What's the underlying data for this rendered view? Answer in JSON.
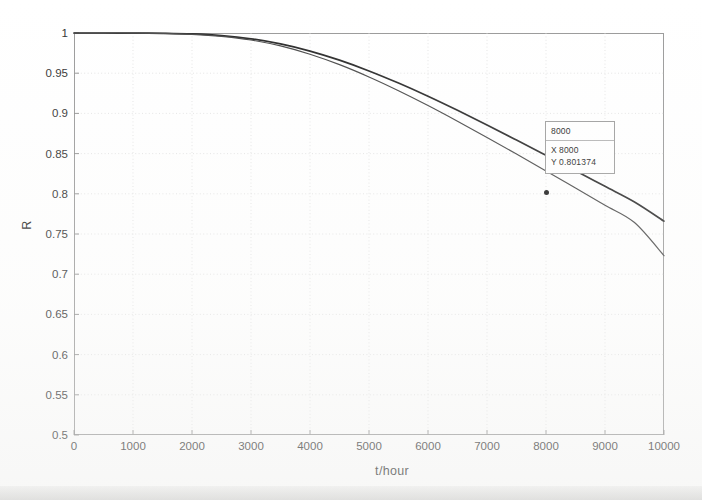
{
  "chart_data": {
    "type": "line",
    "title": "",
    "xlabel": "t/hour",
    "ylabel": "R",
    "xlim": [
      0,
      10000
    ],
    "ylim": [
      0.5,
      1
    ],
    "grid": true,
    "legend_position": "none",
    "xticks": [
      0,
      1000,
      2000,
      3000,
      4000,
      5000,
      6000,
      7000,
      8000,
      9000,
      10000
    ],
    "xtick_labels": [
      "0",
      "1000",
      "2000",
      "3000",
      "4000",
      "5000",
      "6000",
      "7000",
      "8000",
      "9000",
      "10000"
    ],
    "yticks": [
      0.5,
      0.55,
      0.6,
      0.65,
      0.7,
      0.75,
      0.8,
      0.85,
      0.9,
      0.95,
      1
    ],
    "ytick_labels": [
      "0.5",
      "0.55",
      "0.6",
      "0.65",
      "0.7",
      "0.75",
      "0.8",
      "0.85",
      "0.9",
      "0.95",
      "1"
    ],
    "x": [
      0,
      500,
      1000,
      1500,
      2000,
      2500,
      3000,
      3500,
      4000,
      4500,
      5000,
      5500,
      6000,
      6500,
      7000,
      7500,
      8000,
      8500,
      9000,
      9500,
      10000
    ],
    "series": [
      {
        "name": "upper",
        "color": "#2a2a2a",
        "values": [
          1.0,
          1.0,
          0.9999,
          0.9996,
          0.9988,
          0.9968,
          0.9928,
          0.9864,
          0.9775,
          0.9662,
          0.9528,
          0.9377,
          0.9213,
          0.9038,
          0.8856,
          0.8669,
          0.8479,
          0.8287,
          0.8093,
          0.7899,
          0.766
        ]
      },
      {
        "name": "lower",
        "color": "#4a4a4a",
        "values": [
          1.0,
          1.0,
          0.9999,
          0.9995,
          0.9984,
          0.9959,
          0.9913,
          0.9839,
          0.9736,
          0.9606,
          0.9453,
          0.9282,
          0.9098,
          0.8903,
          0.8701,
          0.8494,
          0.8284,
          0.8071,
          0.7857,
          0.7642,
          0.723
        ]
      }
    ]
  },
  "datatip": {
    "title": "8000",
    "x_key": "X",
    "x_value": "8000",
    "y_key": "Y",
    "y_value": "0.801374"
  }
}
